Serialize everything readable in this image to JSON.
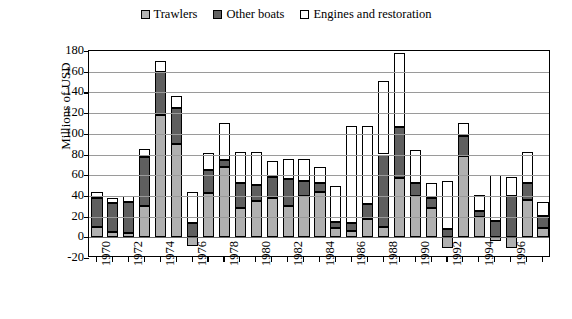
{
  "legend": {
    "position": "top-center",
    "items": [
      {
        "label": "Trawlers",
        "key": "trawlers",
        "color": "#b0b0b0",
        "swatch": "legend-swatch-trawlers"
      },
      {
        "label": "Other boats",
        "key": "other",
        "color": "#5f5f5f",
        "swatch": "legend-swatch-other-boats"
      },
      {
        "label": "Engines and restoration",
        "key": "engines",
        "color": "#ffffff",
        "swatch": "legend-swatch-engines"
      }
    ]
  },
  "axes": {
    "ylabel": "Millions of USD",
    "xlabel": "",
    "ylim": [
      -20,
      180
    ],
    "ystep": 20,
    "yticks": [
      180,
      160,
      140,
      120,
      100,
      80,
      60,
      40,
      20,
      0,
      -20
    ],
    "ytick_labels": [
      "180",
      "160",
      "140",
      "120",
      "100",
      "80",
      "60",
      "40",
      "20",
      "0",
      "-20"
    ],
    "xtick_labels": [
      "1970",
      "1972",
      "1974",
      "1976",
      "1978",
      "1980",
      "1982",
      "1984",
      "1986",
      "1988",
      "1990",
      "1992",
      "1994",
      "1996"
    ],
    "grid": "horizontal"
  },
  "chart_data": {
    "type": "bar",
    "subtype": "stacked",
    "title": "",
    "xlabel": "",
    "ylabel": "Millions of USD",
    "ylim": [
      -20,
      180
    ],
    "grid": true,
    "legend_position": "top-center",
    "categories": [
      "1970",
      "1971",
      "1972",
      "1973",
      "1974",
      "1975",
      "1976",
      "1977",
      "1978",
      "1979",
      "1980",
      "1981",
      "1982",
      "1983",
      "1984",
      "1985",
      "1986",
      "1987",
      "1988",
      "1989",
      "1990",
      "1991",
      "1992",
      "1993",
      "1994",
      "1995",
      "1996",
      "1997",
      "1998"
    ],
    "series": [
      {
        "name": "Trawlers",
        "color": "#b0b0b0",
        "values": [
          10,
          5,
          4,
          30,
          118,
          90,
          -8,
          43,
          68,
          28,
          35,
          38,
          30,
          40,
          44,
          9,
          6,
          18,
          10,
          57,
          40,
          28,
          -10,
          79,
          20,
          -4,
          -10,
          36,
          9
        ]
      },
      {
        "name": "Other boats",
        "color": "#5f5f5f",
        "values": [
          28,
          28,
          30,
          48,
          42,
          35,
          14,
          22,
          7,
          24,
          16,
          20,
          26,
          14,
          8,
          6,
          8,
          14,
          70,
          50,
          12,
          10,
          8,
          19,
          5,
          16,
          40,
          16,
          12
        ]
      },
      {
        "name": "Engines and restoration",
        "color": "#ffffff",
        "values": [
          6,
          5,
          6,
          7,
          10,
          12,
          30,
          16,
          35,
          30,
          31,
          16,
          20,
          22,
          16,
          35,
          94,
          76,
          71,
          71,
          32,
          14,
          46,
          12,
          16,
          44,
          18,
          30,
          13
        ]
      }
    ],
    "totals": [
      44,
      38,
      40,
      85,
      170,
      137,
      44,
      81,
      110,
      82,
      82,
      74,
      76,
      76,
      68,
      50,
      108,
      108,
      151,
      178,
      84,
      52,
      54,
      110,
      41,
      64,
      58,
      82,
      34
    ],
    "negatives": {
      "1976": -8,
      "1992": -10,
      "1995": -4,
      "1996": -10
    }
  }
}
